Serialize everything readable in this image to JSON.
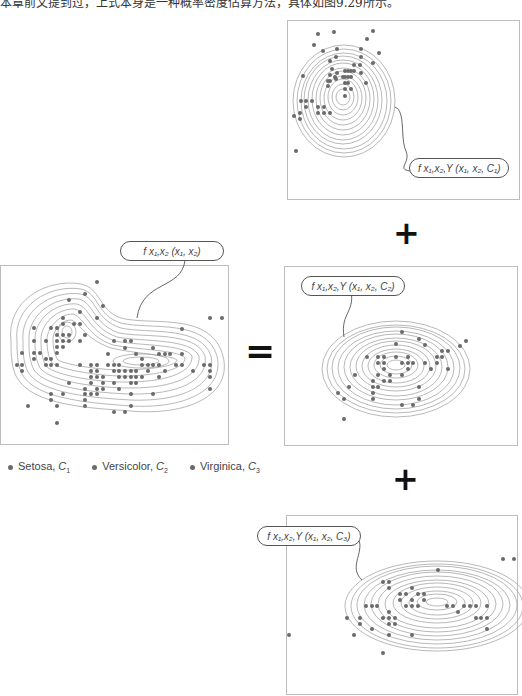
{
  "caption": "本章前文提到过，上式本身是一种概率密度估算方法，具体如图9.29所示。",
  "operators": {
    "equals": "=",
    "plus": "+"
  },
  "legend": {
    "items": [
      {
        "name": "Setosa",
        "class": "C",
        "sub": "1",
        "text": "Setosa, "
      },
      {
        "name": "Versicolor",
        "class": "C",
        "sub": "2",
        "text": "Versicolor, "
      },
      {
        "name": "Virginica",
        "class": "C",
        "sub": "3",
        "text": "Virginica, "
      }
    ]
  },
  "panels": {
    "joint": {
      "label": "f_{x1,x2}(x1, x2)",
      "label_text": "f x₁,x₂ (x₁, x₂)"
    },
    "setosa": {
      "label": "f_{x1,x2,Y}(x1, x2, C1)",
      "label_text": "f x₁,x₂,Y (x₁, x₂, C₁)"
    },
    "versicolor": {
      "label": "f_{x1,x2,Y}(x1, x2, C2)",
      "label_text": "f x₁,x₂,Y (x₁, x₂, C₂)"
    },
    "virginica": {
      "label": "f_{x1,x2,Y}(x1, x2, C3)",
      "label_text": "f x₁,x₂,Y (x₁, x₂, C₃)"
    }
  },
  "colors": {
    "dot": "#6a6a6a",
    "contour": "#9a9a9a",
    "border": "#bdbdbd",
    "pill_border": "#555555"
  }
}
